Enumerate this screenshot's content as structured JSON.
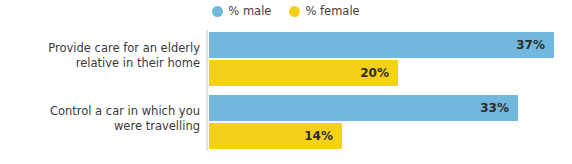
{
  "legend": {
    "position": "top-center",
    "entries": [
      {
        "label": "% male",
        "color": "#72b8dc",
        "marker": "circle-icon"
      },
      {
        "label": "% female",
        "color": "#f5d019",
        "marker": "circle-icon"
      }
    ]
  },
  "axis": {
    "line_color": "#e3e3e3",
    "x_min": 0,
    "x_max": 40,
    "grid": false,
    "tick_labels": []
  },
  "categories": [
    {
      "line1": "Provide care for an elderly",
      "line2": "relative in their home"
    },
    {
      "line1": "Control a car in which you",
      "line2": "were travelling"
    }
  ],
  "bars": [
    {
      "category_index": 0,
      "series": "% male",
      "value": 37,
      "label": "37%",
      "color": "#72b8dc",
      "width_px": 345
    },
    {
      "category_index": 0,
      "series": "% female",
      "value": 20,
      "label": "20%",
      "color": "#f5d019",
      "width_px": 189
    },
    {
      "category_index": 1,
      "series": "% male",
      "value": 33,
      "label": "33%",
      "color": "#72b8dc",
      "width_px": 309
    },
    {
      "category_index": 1,
      "series": "% female",
      "value": 14,
      "label": "14%",
      "color": "#f5d019",
      "width_px": 133
    }
  ],
  "chart_data": {
    "type": "bar",
    "orientation": "horizontal",
    "title": "",
    "subtitle": "",
    "xlabel": "",
    "ylabel": "",
    "xlim": [
      0,
      40
    ],
    "grid": false,
    "legend_position": "top-center",
    "categories": [
      "Provide care for an elderly relative in their home",
      "Control a car in which you were travelling"
    ],
    "series": [
      {
        "name": "% male",
        "color": "#72b8dc",
        "values": [
          37,
          33
        ],
        "value_labels": [
          "37%",
          "33%"
        ]
      },
      {
        "name": "% female",
        "color": "#f5d019",
        "values": [
          20,
          14
        ],
        "value_labels": [
          "20%",
          "14%"
        ]
      }
    ],
    "annotations": []
  }
}
